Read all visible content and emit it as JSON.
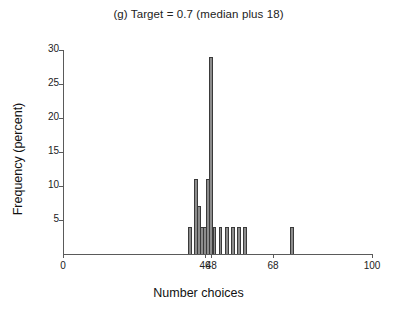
{
  "chart_data": {
    "type": "bar",
    "title": "(g) Target = 0.7 (median plus 18)",
    "xlabel": "Number choices",
    "ylabel": "Frequency (percent)",
    "xlim": [
      0,
      100
    ],
    "ylim": [
      0,
      30
    ],
    "grid": false,
    "legend": null,
    "xticks": [
      {
        "value": 0,
        "label": "0"
      },
      {
        "value": 46,
        "label": "46"
      },
      {
        "value": 48,
        "label": "48"
      },
      {
        "value": 68,
        "label": "68"
      },
      {
        "value": 100,
        "label": "100"
      }
    ],
    "yticks": [
      {
        "value": 5,
        "label": "5"
      },
      {
        "value": 10,
        "label": "10"
      },
      {
        "value": 15,
        "label": "15"
      },
      {
        "value": 20,
        "label": "20"
      },
      {
        "value": 25,
        "label": "25"
      },
      {
        "value": 30,
        "label": "30"
      }
    ],
    "x": [
      41,
      43,
      44,
      45,
      46,
      47,
      48,
      49,
      51,
      53,
      55,
      57,
      59,
      74
    ],
    "values": [
      4,
      11,
      7,
      4,
      4,
      11,
      29,
      4,
      4,
      4,
      4,
      4,
      4,
      4
    ],
    "bar_width": 1.2,
    "series": [
      {
        "name": "Frequency (percent)",
        "points": [
          {
            "x": 41,
            "y": 4
          },
          {
            "x": 43,
            "y": 11
          },
          {
            "x": 44,
            "y": 7
          },
          {
            "x": 45,
            "y": 4
          },
          {
            "x": 46,
            "y": 4
          },
          {
            "x": 47,
            "y": 11
          },
          {
            "x": 48,
            "y": 29
          },
          {
            "x": 49,
            "y": 4
          },
          {
            "x": 51,
            "y": 4
          },
          {
            "x": 53,
            "y": 4
          },
          {
            "x": 55,
            "y": 4
          },
          {
            "x": 57,
            "y": 4
          },
          {
            "x": 59,
            "y": 4
          },
          {
            "x": 74,
            "y": 4
          }
        ]
      }
    ],
    "colors": {
      "bar_fill": "#8c8c8c",
      "bar_edge": "#3a3a3a",
      "axis": "#5a5a5a",
      "text": "#111111",
      "background": "#ffffff"
    }
  }
}
